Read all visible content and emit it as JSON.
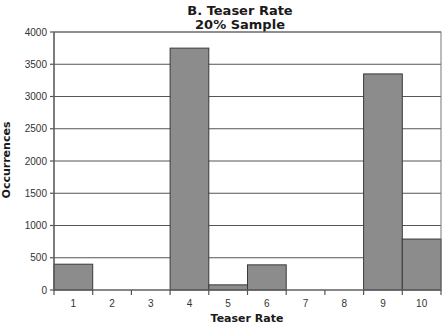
{
  "chart_data": {
    "type": "bar",
    "title": "B. Teaser Rate",
    "subtitle": "20% Sample",
    "xlabel": "Teaser Rate",
    "ylabel": "Occurrences",
    "categories": [
      "1",
      "2",
      "3",
      "4",
      "5",
      "6",
      "7",
      "8",
      "9",
      "10"
    ],
    "values": [
      400,
      0,
      0,
      3750,
      80,
      390,
      0,
      0,
      3350,
      790
    ],
    "ylim": [
      0,
      4000
    ],
    "yticks": [
      0,
      500,
      1000,
      1500,
      2000,
      2500,
      3000,
      3500,
      4000
    ],
    "grid": true,
    "legend": "none",
    "colors": {
      "bar_fill": "#8c8c8c",
      "bar_stroke": "#3a3a3a",
      "grid": "#555555"
    }
  }
}
